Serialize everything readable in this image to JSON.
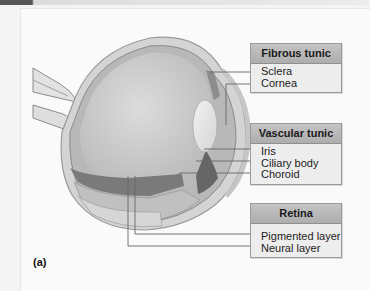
{
  "figure": {
    "label": "(a)"
  },
  "groups": [
    {
      "title": "Fibrous tunic",
      "items": [
        "Sclera",
        "Cornea"
      ]
    },
    {
      "title": "Vascular tunic",
      "items": [
        "Iris",
        "Ciliary body",
        "Choroid"
      ]
    },
    {
      "title": "Retina",
      "items": [
        "Pigmented layer",
        "Neural layer"
      ]
    }
  ],
  "colors": {
    "header_bg": "#b5b5b5",
    "box_bg": "#ededed",
    "leader_line": "#666666",
    "sclera": "#d0d0d0",
    "choroid": "#6e6e6e",
    "vitreous": "#c9c9c9"
  }
}
